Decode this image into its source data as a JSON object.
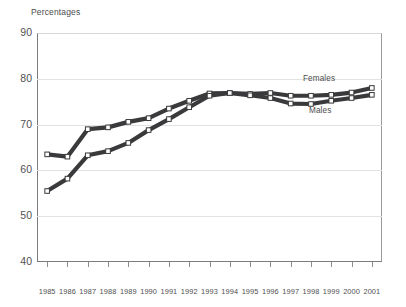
{
  "chart_data": {
    "type": "line",
    "title": "Percentages",
    "ylabel": "Percentages",
    "xlabel": "",
    "grid": true,
    "legend_position": "inline-annotation",
    "ylim": [
      40,
      90
    ],
    "yticks": [
      90,
      80,
      70,
      60,
      50,
      40
    ],
    "categories": [
      "1985",
      "1986",
      "1987",
      "1988",
      "1989",
      "1990",
      "1991",
      "1992",
      "1993",
      "1994",
      "1995",
      "1996",
      "1997",
      "1998",
      "1999",
      "2000",
      "2001"
    ],
    "series": [
      {
        "name": "Females",
        "color": "#3a3a3c",
        "marker": "open-square",
        "values": [
          63.5,
          63.0,
          69.0,
          69.4,
          70.6,
          71.4,
          73.5,
          75.2,
          76.8,
          76.9,
          76.7,
          76.9,
          76.3,
          76.3,
          76.5,
          77.0,
          78.0
        ]
      },
      {
        "name": "Males",
        "color": "#3a3a3c",
        "marker": "open-square",
        "values": [
          55.5,
          58.2,
          63.3,
          64.2,
          66.0,
          68.8,
          71.2,
          73.8,
          76.3,
          76.9,
          76.4,
          75.8,
          74.6,
          74.5,
          75.2,
          75.8,
          76.5
        ]
      }
    ],
    "annotations": [
      {
        "text": "Females",
        "x_year": "1998",
        "y_value": 79.2
      },
      {
        "text": "Males",
        "x_year": "1998",
        "y_value": 72.3
      }
    ]
  }
}
